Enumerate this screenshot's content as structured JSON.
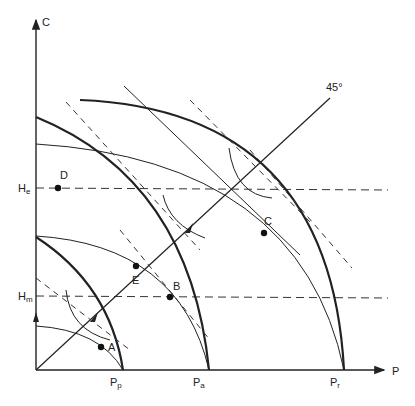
{
  "diagram": {
    "axes": {
      "y_label": "C",
      "x_label": "P",
      "angle_label": "45°"
    },
    "x_ticks": [
      {
        "main": "P",
        "sub": "p"
      },
      {
        "main": "P",
        "sub": "a"
      },
      {
        "main": "P",
        "sub": "r"
      }
    ],
    "y_ticks": [
      {
        "main": "H",
        "sub": "e"
      },
      {
        "main": "H",
        "sub": "m"
      }
    ],
    "points": [
      "A",
      "B",
      "C",
      "D",
      "E"
    ],
    "colors": {
      "ink": "#222222",
      "background": "#ffffff"
    }
  }
}
